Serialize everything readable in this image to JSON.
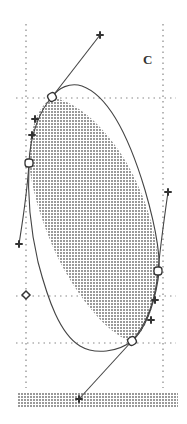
{
  "figure": {
    "label": "C",
    "colors": {
      "stroke": "#444444",
      "grid": "#888888",
      "stipple": "#9a9a9a",
      "background": "#ffffff"
    },
    "grid": {
      "vertical_x": [
        26,
        163
      ],
      "horizontal_y": [
        98,
        296,
        343
      ]
    },
    "anchor_points": [
      {
        "name": "top-anchor",
        "x": 52,
        "y": 97
      },
      {
        "name": "left-anchor",
        "x": 29,
        "y": 163
      },
      {
        "name": "right-anchor",
        "x": 158,
        "y": 271
      },
      {
        "name": "bottom-anchor",
        "x": 132,
        "y": 341
      }
    ],
    "control_points": [
      {
        "name": "top-handle",
        "x": 100,
        "y": 35
      },
      {
        "name": "upper-left-handle-1",
        "x": 35,
        "y": 119
      },
      {
        "name": "upper-left-handle-2",
        "x": 32,
        "y": 135
      },
      {
        "name": "left-handle",
        "x": 19,
        "y": 244
      },
      {
        "name": "right-handle",
        "x": 168,
        "y": 192
      },
      {
        "name": "lower-right-handle-1",
        "x": 155,
        "y": 300
      },
      {
        "name": "lower-right-handle-2",
        "x": 151,
        "y": 320
      },
      {
        "name": "bottom-handle",
        "x": 79,
        "y": 399
      },
      {
        "name": "left-diamond",
        "x": 26,
        "y": 295
      }
    ]
  }
}
